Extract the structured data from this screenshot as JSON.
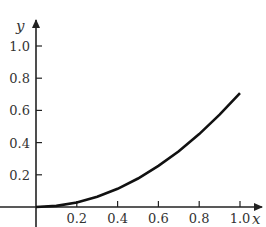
{
  "chart_data": {
    "type": "line",
    "title": "",
    "xlabel": "x",
    "ylabel": "y",
    "xlim": [
      0,
      1.0
    ],
    "ylim": [
      0,
      1.0
    ],
    "grid": false,
    "legend": null,
    "x_ticks": [
      "0.2",
      "0.4",
      "0.6",
      "0.8",
      "1.0"
    ],
    "y_ticks": [
      "0.2",
      "0.4",
      "0.6",
      "0.8",
      "1.0"
    ],
    "series": [
      {
        "name": "curve",
        "x": [
          0,
          0.1,
          0.2,
          0.3,
          0.4,
          0.5,
          0.6,
          0.7,
          0.8,
          0.9,
          1.0
        ],
        "y": [
          0,
          0.007,
          0.028,
          0.064,
          0.113,
          0.177,
          0.255,
          0.346,
          0.453,
          0.573,
          0.707
        ]
      }
    ],
    "colors": {
      "axis": "#222222",
      "curve": "#111111",
      "text": "#333333"
    }
  }
}
